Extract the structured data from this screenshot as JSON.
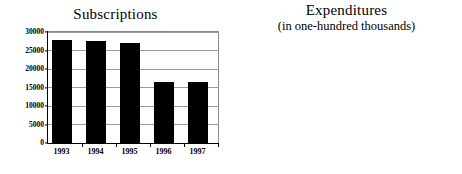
{
  "chart_data": [
    {
      "id": "subscriptions",
      "type": "bar",
      "title": "Subscriptions",
      "subtitle": "",
      "xlabel": "",
      "ylabel": "",
      "categories": [
        "1993",
        "1994",
        "1995",
        "1996",
        "1997"
      ],
      "values": [
        27800,
        27700,
        26900,
        16400,
        16400
      ],
      "ylim": [
        0,
        30000
      ],
      "yticks": [
        0,
        5000,
        10000,
        15000,
        20000,
        25000,
        30000
      ],
      "ytick_labels": [
        "0",
        "5000",
        "10000",
        "15000",
        "20000",
        "25000",
        "30000"
      ],
      "grid": true,
      "legend": "none",
      "bar_color": "#000000"
    },
    {
      "id": "expenditures",
      "type": "bar",
      "title": "Expenditures",
      "subtitle": "(in one-hundred thousands)",
      "xlabel": "",
      "ylabel": "",
      "categories": [
        "1993",
        "1994",
        "1995",
        "1996",
        "1997"
      ],
      "values": [
        30.1,
        30.9,
        33.0,
        35.8,
        37.7
      ],
      "ylim": [
        0,
        40
      ],
      "yticks": [
        0,
        5,
        10,
        15,
        20,
        25,
        30,
        35,
        40
      ],
      "ytick_labels": [
        "0",
        "5",
        "10",
        "15",
        "20",
        "25",
        "30",
        "35",
        "40"
      ],
      "grid": true,
      "legend": "none",
      "bar_color": "#000000"
    }
  ]
}
